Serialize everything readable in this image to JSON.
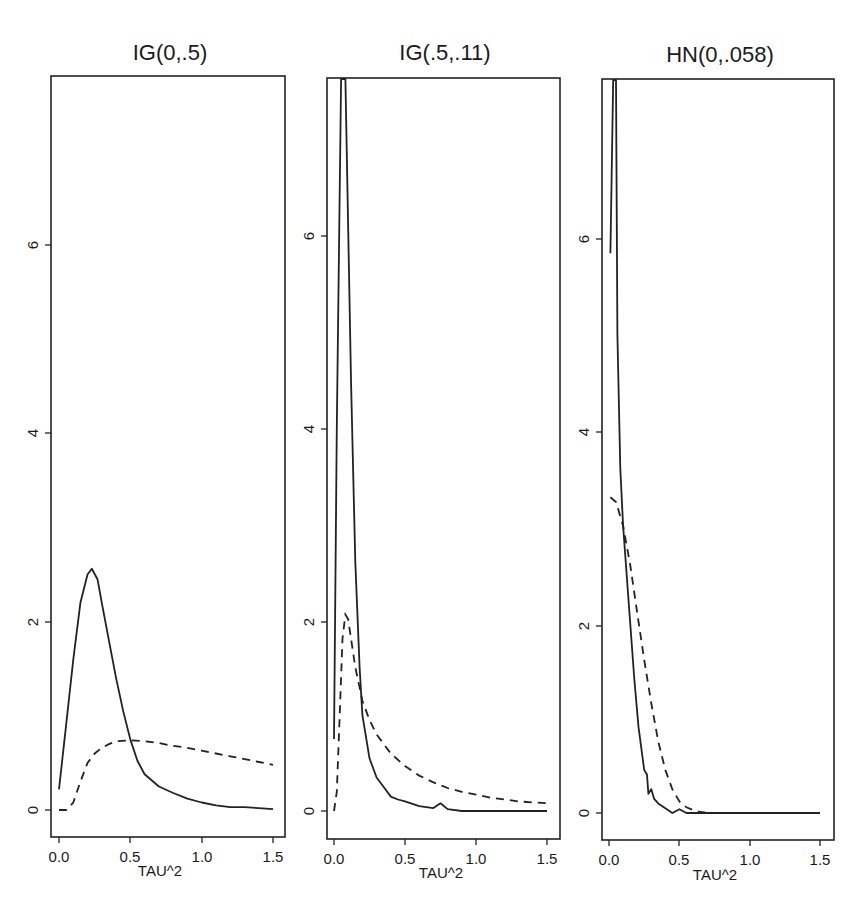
{
  "chart_data": [
    {
      "type": "line",
      "title": "IG(0,.5)",
      "xlabel": "TAU^2",
      "ylabel": "",
      "xticks": [
        "0.0",
        "0.5",
        "1.0",
        "1.5"
      ],
      "yticks": [
        "0",
        "2",
        "4",
        "6"
      ],
      "xlim": [
        0,
        1.5
      ],
      "ylim": [
        0,
        7.7
      ],
      "grid": false,
      "legend": null,
      "series": [
        {
          "name": "posterior",
          "style": "solid",
          "x": [
            0.0,
            0.05,
            0.1,
            0.15,
            0.2,
            0.23,
            0.27,
            0.3,
            0.35,
            0.4,
            0.45,
            0.5,
            0.55,
            0.6,
            0.7,
            0.8,
            0.9,
            1.0,
            1.1,
            1.2,
            1.3,
            1.4,
            1.5
          ],
          "y": [
            0.22,
            0.9,
            1.6,
            2.2,
            2.5,
            2.56,
            2.45,
            2.2,
            1.8,
            1.4,
            1.05,
            0.75,
            0.52,
            0.38,
            0.25,
            0.18,
            0.12,
            0.08,
            0.05,
            0.03,
            0.03,
            0.02,
            0.01
          ]
        },
        {
          "name": "prior",
          "style": "dashed",
          "x": [
            0.0,
            0.05,
            0.1,
            0.15,
            0.2,
            0.25,
            0.3,
            0.35,
            0.4,
            0.5,
            0.6,
            0.7,
            0.8,
            0.9,
            1.0,
            1.1,
            1.2,
            1.3,
            1.4,
            1.5
          ],
          "y": [
            0.0,
            0.0,
            0.08,
            0.3,
            0.5,
            0.6,
            0.66,
            0.7,
            0.73,
            0.74,
            0.73,
            0.71,
            0.68,
            0.66,
            0.63,
            0.6,
            0.57,
            0.54,
            0.51,
            0.48
          ]
        }
      ]
    },
    {
      "type": "line",
      "title": "IG(.5,.11)",
      "xlabel": "TAU^2",
      "ylabel": "",
      "xticks": [
        "0.0",
        "0.5",
        "1.0",
        "1.5"
      ],
      "yticks": [
        "0",
        "2",
        "4",
        "6"
      ],
      "xlim": [
        0,
        1.5
      ],
      "ylim": [
        0,
        7.7
      ],
      "grid": false,
      "legend": null,
      "series": [
        {
          "name": "posterior",
          "style": "solid",
          "x": [
            0.0,
            0.02,
            0.05,
            0.08,
            0.12,
            0.15,
            0.18,
            0.2,
            0.25,
            0.3,
            0.35,
            0.4,
            0.45,
            0.5,
            0.6,
            0.7,
            0.75,
            0.8,
            0.9,
            1.0,
            1.2,
            1.5
          ],
          "y": [
            0.75,
            4.0,
            7.7,
            7.7,
            4.5,
            2.6,
            1.5,
            1.0,
            0.55,
            0.35,
            0.25,
            0.15,
            0.12,
            0.1,
            0.05,
            0.03,
            0.08,
            0.02,
            0.0,
            0.0,
            0.0,
            0.0
          ]
        },
        {
          "name": "prior",
          "style": "dashed",
          "x": [
            0.0,
            0.02,
            0.04,
            0.06,
            0.08,
            0.1,
            0.12,
            0.15,
            0.2,
            0.25,
            0.3,
            0.4,
            0.5,
            0.6,
            0.7,
            0.8,
            0.9,
            1.0,
            1.1,
            1.2,
            1.3,
            1.4,
            1.5
          ],
          "y": [
            0.0,
            0.2,
            1.0,
            1.8,
            2.05,
            2.0,
            1.8,
            1.5,
            1.15,
            0.95,
            0.8,
            0.6,
            0.47,
            0.37,
            0.3,
            0.24,
            0.2,
            0.17,
            0.14,
            0.12,
            0.1,
            0.09,
            0.08
          ]
        }
      ]
    },
    {
      "type": "line",
      "title": "HN(0,.058)",
      "xlabel": "TAU^2",
      "ylabel": "",
      "xticks": [
        "0.0",
        "0.5",
        "1.0",
        "1.5"
      ],
      "yticks": [
        "0",
        "2",
        "4",
        "6"
      ],
      "xlim": [
        0,
        1.5
      ],
      "ylim": [
        0,
        7.7
      ],
      "grid": false,
      "legend": null,
      "series": [
        {
          "name": "posterior",
          "style": "solid",
          "x": [
            0.01,
            0.03,
            0.05,
            0.06,
            0.08,
            0.1,
            0.12,
            0.15,
            0.18,
            0.21,
            0.25,
            0.27,
            0.28,
            0.3,
            0.32,
            0.35,
            0.4,
            0.45,
            0.5,
            0.55,
            0.6,
            0.7,
            0.8,
            1.0,
            1.2,
            1.5
          ],
          "y": [
            5.85,
            7.7,
            7.7,
            5.0,
            3.6,
            3.0,
            2.6,
            2.0,
            1.4,
            0.9,
            0.45,
            0.4,
            0.2,
            0.25,
            0.15,
            0.1,
            0.05,
            0.0,
            0.04,
            0.0,
            0.0,
            0.0,
            0.0,
            0.0,
            0.0,
            0.0
          ]
        },
        {
          "name": "prior",
          "style": "dashed",
          "x": [
            0.01,
            0.05,
            0.1,
            0.15,
            0.2,
            0.25,
            0.3,
            0.35,
            0.4,
            0.45,
            0.5,
            0.55,
            0.6,
            0.65,
            0.7,
            0.8,
            1.0,
            1.2,
            1.5
          ],
          "y": [
            3.3,
            3.25,
            3.0,
            2.6,
            2.1,
            1.6,
            1.15,
            0.75,
            0.45,
            0.25,
            0.12,
            0.06,
            0.03,
            0.01,
            0.0,
            0.0,
            0.0,
            0.0,
            0.0
          ]
        }
      ]
    }
  ],
  "panels": [
    {
      "title": "IG(0,.5)",
      "xlabel": "TAU^2"
    },
    {
      "title": "IG(.5,.11)",
      "xlabel": "TAU^2"
    },
    {
      "title": "HN(0,.058)",
      "xlabel": "TAU^2"
    }
  ]
}
